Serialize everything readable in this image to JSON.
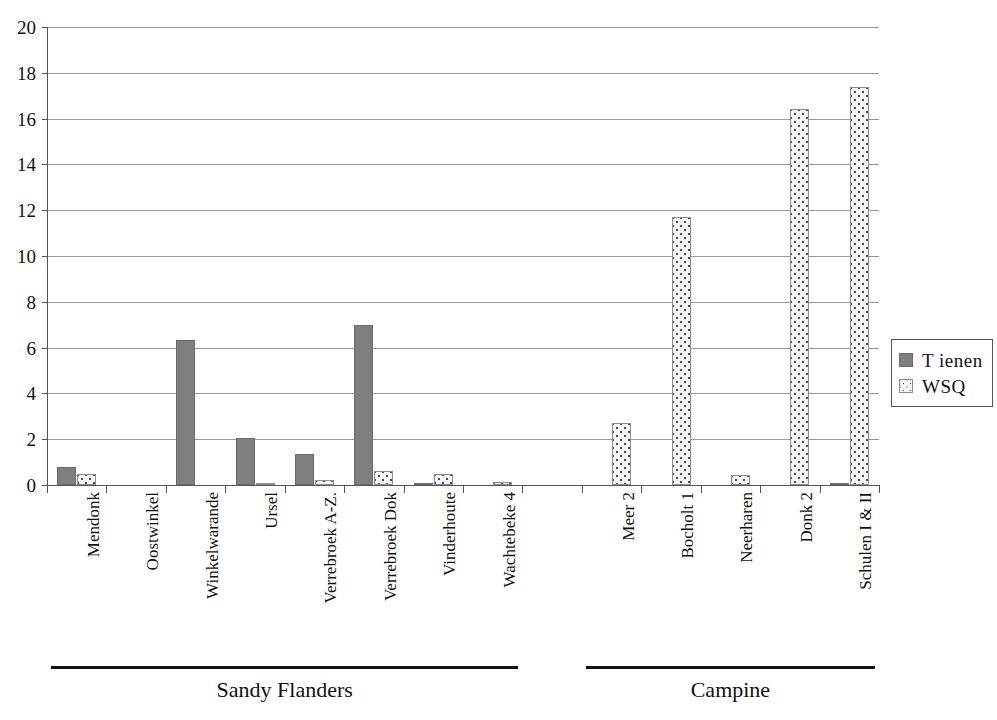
{
  "chart_data": {
    "type": "bar",
    "title": "",
    "xlabel": "",
    "ylabel": "",
    "ylim": [
      0,
      20
    ],
    "ytick_step": 2,
    "yticks": [
      "20",
      "18",
      "16",
      "14",
      "12",
      "10",
      "8",
      "6",
      "4",
      "2",
      "0"
    ],
    "grid": true,
    "legend_position": "right",
    "categories": [
      "Mendonk",
      "Oostwinkel",
      "Winkelwarande",
      "Ursel",
      "Verrebroek A-Z.",
      "Verrebroek Dok",
      "Vinderhoute",
      "Wachtebeke 4",
      "",
      "Meer 2",
      "Bocholt 1",
      "Neerharen",
      "Donk 2",
      "Schulen I & II"
    ],
    "series": [
      {
        "name": "Tienen",
        "color": "#7f7f7f",
        "pattern": "solid",
        "values": [
          0.8,
          0,
          6.35,
          2.05,
          1.35,
          7.0,
          0.1,
          0,
          0,
          0,
          0,
          0,
          0,
          0.1
        ]
      },
      {
        "name": "WSQ",
        "color": "#f4f4f4",
        "pattern": "dotted",
        "values": [
          0.5,
          0,
          0,
          0.1,
          0.2,
          0.6,
          0.5,
          0.15,
          0,
          2.7,
          11.7,
          0.45,
          16.4,
          17.4
        ]
      }
    ],
    "groups": [
      {
        "label": "Sandy Flanders",
        "from": 0,
        "to": 7
      },
      {
        "label": "Campine",
        "from": 9,
        "to": 13
      }
    ]
  },
  "legend": {
    "entries": [
      {
        "label": "T ienen",
        "swatch": "tienen"
      },
      {
        "label": "WSQ",
        "swatch": "wsq"
      }
    ]
  }
}
